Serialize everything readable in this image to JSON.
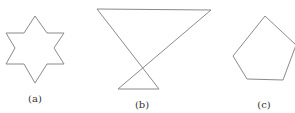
{
  "figures": [
    {
      "label": "(a)",
      "shape": "six-pointed-star",
      "points": "35,16 47,33 64,33 54,48 64,64 47,64 35,83 24,64 6,64 15,48 6,33 24,33",
      "label_pos": {
        "x": 35,
        "y": 94
      }
    },
    {
      "label": "(b)",
      "shape": "self-intersecting-quadrilateral",
      "points": "97,9 211,10 118,89 159,89",
      "label_pos": {
        "x": 142,
        "y": 100
      }
    },
    {
      "label": "(c)",
      "shape": "pentagon",
      "points": "265,16 296,45 283,80 247,79 233,56",
      "label_pos": {
        "x": 264,
        "y": 100
      }
    }
  ],
  "colors": {
    "stroke": "#8a8a8a",
    "text": "#333333",
    "background": "#ffffff"
  }
}
